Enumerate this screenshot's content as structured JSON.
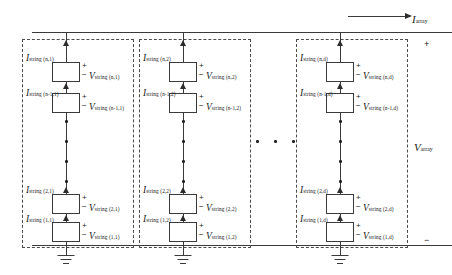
{
  "diagram": {
    "array": {
      "current_label": {
        "symbol": "I",
        "subscript": "array"
      },
      "voltage_label": {
        "symbol": "V",
        "subscript": "array"
      },
      "plus_sign": "+",
      "minus_sign": "−"
    },
    "polarity": {
      "plus": "+",
      "minus": "−"
    },
    "ellipsis_dot": "·",
    "columns": [
      {
        "name": "string-column-1",
        "rows": [
          {
            "row_id": "n",
            "current": {
              "symbol": "I",
              "subscript": "string (n,1)"
            },
            "voltage": {
              "symbol": "V",
              "subscript": "string (n,1)"
            }
          },
          {
            "row_id": "n-1",
            "current": {
              "symbol": "I",
              "subscript": "string (n-1,1)"
            },
            "voltage": {
              "symbol": "V",
              "subscript": "string (n-1,1)"
            }
          },
          {
            "row_id": "2",
            "current": {
              "symbol": "I",
              "subscript": "string (2,1)"
            },
            "voltage": {
              "symbol": "V",
              "subscript": "string (2,1)"
            }
          },
          {
            "row_id": "1",
            "current": {
              "symbol": "I",
              "subscript": "string (1,1)"
            },
            "voltage": {
              "symbol": "V",
              "subscript": "string (1,1)"
            }
          }
        ]
      },
      {
        "name": "string-column-2",
        "rows": [
          {
            "row_id": "n",
            "current": {
              "symbol": "I",
              "subscript": "string (n,2)"
            },
            "voltage": {
              "symbol": "V",
              "subscript": "string (n,2)"
            }
          },
          {
            "row_id": "n-1",
            "current": {
              "symbol": "I",
              "subscript": "string (n-1,2)"
            },
            "voltage": {
              "symbol": "V",
              "subscript": "string (n-1,2)"
            }
          },
          {
            "row_id": "2",
            "current": {
              "symbol": "I",
              "subscript": "string (2,2)"
            },
            "voltage": {
              "symbol": "V",
              "subscript": "string (2,2)"
            }
          },
          {
            "row_id": "1",
            "current": {
              "symbol": "I",
              "subscript": "string (1,2)"
            },
            "voltage": {
              "symbol": "V",
              "subscript": "string (1,2)"
            }
          }
        ]
      },
      {
        "name": "string-column-d",
        "rows": [
          {
            "row_id": "n",
            "current": {
              "symbol": "I",
              "subscript": "string (n,d)"
            },
            "voltage": {
              "symbol": "V",
              "subscript": "string (n,d)"
            }
          },
          {
            "row_id": "n-1",
            "current": {
              "symbol": "I",
              "subscript": "string (n-1,d)"
            },
            "voltage": {
              "symbol": "V",
              "subscript": "string (n-1,d)"
            }
          },
          {
            "row_id": "2",
            "current": {
              "symbol": "I",
              "subscript": "string (2,d)"
            },
            "voltage": {
              "symbol": "V",
              "subscript": "string (2,d)"
            }
          },
          {
            "row_id": "1",
            "current": {
              "symbol": "I",
              "subscript": "string (1,d)"
            },
            "voltage": {
              "symbol": "V",
              "subscript": "string (1,d)"
            }
          }
        ]
      }
    ],
    "colors": {
      "wire": "#3a3a3a",
      "dashed_box": "#4a4a4a",
      "text": "#1b1b1b"
    }
  }
}
